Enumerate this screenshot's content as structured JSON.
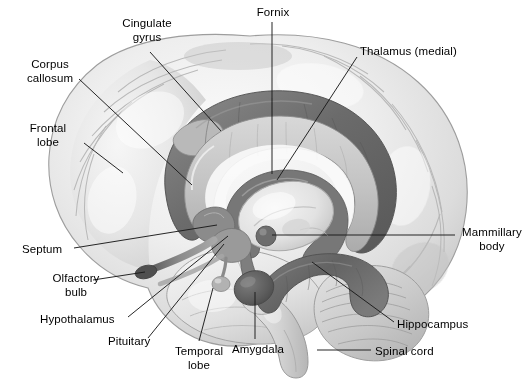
{
  "figure": {
    "background_color": "#ffffff",
    "text_color": "#000000",
    "leader_line_color": "#1a1a1a"
  },
  "palette": {
    "cortex_light": "#f2f2f2",
    "cortex_mid": "#dcdcdc",
    "cortex_shadow": "#bdbdbd",
    "outline": "#9a9a9a",
    "limbic_dark": "#6f6f6f",
    "limbic_darker": "#5a5a5a",
    "limbic_mid": "#8f8f8f",
    "corpus_callosum": "#cfcfcf",
    "thalamus": "#e6e6e6",
    "cerebellum": "#c9c9c9"
  },
  "labels": [
    {
      "id": "cingulate-gyrus",
      "text": "Cingulate\ngyrus",
      "x": 112,
      "y": 17,
      "align": "center",
      "width": 70
    },
    {
      "id": "fornix",
      "text": "Fornix",
      "x": 250,
      "y": 6,
      "align": "center",
      "width": 46
    },
    {
      "id": "thalamus-medial",
      "text": "Thalamus (medial)",
      "x": 360,
      "y": 45,
      "align": "left",
      "width": 110
    },
    {
      "id": "corpus-callosum",
      "text": "Corpus\ncallosum",
      "x": 15,
      "y": 58,
      "align": "center",
      "width": 70
    },
    {
      "id": "frontal-lobe",
      "text": "Frontal\nlobe",
      "x": 18,
      "y": 122,
      "align": "center",
      "width": 60
    },
    {
      "id": "mammillary-body",
      "text": "Mammillary\nbody",
      "x": 458,
      "y": 226,
      "align": "center",
      "width": 68
    },
    {
      "id": "septum",
      "text": "Septum",
      "x": 22,
      "y": 243,
      "align": "left",
      "width": 48
    },
    {
      "id": "olfactory-bulb",
      "text": "Olfactory\nbulb",
      "x": 45,
      "y": 272,
      "align": "center",
      "width": 62
    },
    {
      "id": "hypothalamus",
      "text": "Hypothalamus",
      "x": 40,
      "y": 313,
      "align": "left",
      "width": 84
    },
    {
      "id": "hippocampus",
      "text": "Hippocampus",
      "x": 397,
      "y": 318,
      "align": "left",
      "width": 82
    },
    {
      "id": "pituitary",
      "text": "Pituitary",
      "x": 108,
      "y": 335,
      "align": "left",
      "width": 56
    },
    {
      "id": "amygdala",
      "text": "Amygdala",
      "x": 232,
      "y": 343,
      "align": "left",
      "width": 62
    },
    {
      "id": "spinal-cord",
      "text": "Spinal cord",
      "x": 375,
      "y": 345,
      "align": "left",
      "width": 72
    },
    {
      "id": "temporal-lobe",
      "text": "Temporal\nlobe",
      "x": 168,
      "y": 345,
      "align": "center",
      "width": 62
    }
  ],
  "leaders": [
    {
      "id": "leader-cingulate-gyrus",
      "points": "150,52 221,131"
    },
    {
      "id": "leader-fornix",
      "points": "272,22 272,174"
    },
    {
      "id": "leader-thalamus",
      "points": "357,57 277,180"
    },
    {
      "id": "leader-corpus-callosum",
      "points": "79,79 192,185"
    },
    {
      "id": "leader-frontal-lobe",
      "points": "84,143 123,173"
    },
    {
      "id": "leader-mammillary",
      "points": "455,235 272,235"
    },
    {
      "id": "leader-septum",
      "points": "74,248 217,225"
    },
    {
      "id": "leader-olfactory-bulb",
      "points": "93,280 145,272"
    },
    {
      "id": "leader-hypothalamus",
      "points": "128,317 228,236"
    },
    {
      "id": "leader-hippocampus",
      "points": "394,322 312,262"
    },
    {
      "id": "leader-pituitary",
      "points": "148,338 224,244"
    },
    {
      "id": "leader-amygdala",
      "points": "255,339 255,292"
    },
    {
      "id": "leader-spinal-cord",
      "points": "371,350 317,350"
    },
    {
      "id": "leader-temporal-lobe",
      "points": "199,341 213,288"
    }
  ],
  "structures": [
    {
      "id": "cerebral-cortex",
      "name": "Cerebral cortex (medial surface)"
    },
    {
      "id": "frontal-lobe",
      "name": "Frontal lobe"
    },
    {
      "id": "temporal-lobe",
      "name": "Temporal lobe"
    },
    {
      "id": "cingulate-gyrus",
      "name": "Cingulate gyrus"
    },
    {
      "id": "corpus-callosum",
      "name": "Corpus callosum"
    },
    {
      "id": "fornix",
      "name": "Fornix"
    },
    {
      "id": "thalamus",
      "name": "Thalamus (medial)"
    },
    {
      "id": "hypothalamus",
      "name": "Hypothalamus"
    },
    {
      "id": "mammillary-body",
      "name": "Mammillary body"
    },
    {
      "id": "amygdala",
      "name": "Amygdala"
    },
    {
      "id": "hippocampus",
      "name": "Hippocampus"
    },
    {
      "id": "septum",
      "name": "Septum"
    },
    {
      "id": "olfactory-bulb",
      "name": "Olfactory bulb"
    },
    {
      "id": "pituitary",
      "name": "Pituitary"
    },
    {
      "id": "cerebellum",
      "name": "Cerebellum"
    },
    {
      "id": "brainstem",
      "name": "Brainstem"
    },
    {
      "id": "spinal-cord",
      "name": "Spinal cord"
    }
  ]
}
